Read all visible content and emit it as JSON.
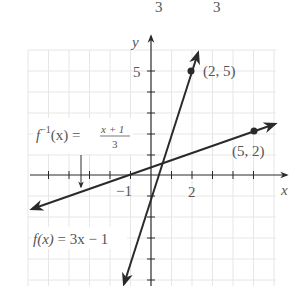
{
  "top_fragment": {
    "glyphs": [
      "3",
      "3"
    ]
  },
  "axes": {
    "x_label": "x",
    "y_label": "y",
    "x_tick_labels": [
      {
        "value": -1,
        "text": "−1"
      },
      {
        "value": 2,
        "text": "2"
      }
    ],
    "y_tick_labels": [
      {
        "value": 5,
        "text": "5"
      }
    ],
    "x_range": [
      -6,
      6
    ],
    "y_range": [
      -5,
      6
    ]
  },
  "functions": {
    "f": {
      "label_name": "f(x)",
      "label_eq": " = 3x − 1",
      "expression": "3x - 1"
    },
    "f_inverse": {
      "label_prefix": "f",
      "label_sup": "−1",
      "label_arg": "(x) =",
      "num": "x + 1",
      "den": "3",
      "expression": "(x+1)/3"
    }
  },
  "points": [
    {
      "text": "(2, 5)",
      "x": 2,
      "y": 5,
      "on": "f"
    },
    {
      "text": "(5, 2)",
      "x": 5,
      "y": 2,
      "on": "f_inverse"
    }
  ],
  "colors": {
    "ink": "#2a2a2a",
    "grid": "#e6e6e6",
    "text": "#555555"
  }
}
